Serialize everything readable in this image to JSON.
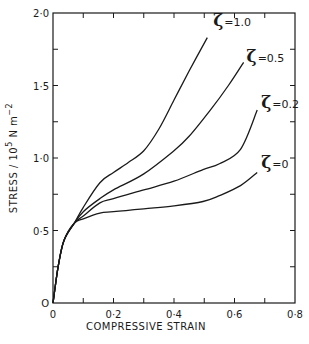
{
  "chart_data": {
    "type": "line",
    "title": "",
    "xlabel": "COMPRESSIVE STRAIN",
    "ylabel": "STRESS / 10^5 N m^-2",
    "ylabel_parts": {
      "main": "STRESS / 10",
      "exp1": "5",
      "unit": " N m",
      "exp2": "−2"
    },
    "xlim": [
      0,
      0.8
    ],
    "ylim": [
      0,
      2.0
    ],
    "x_ticks": [
      0,
      0.1,
      0.2,
      0.3,
      0.4,
      0.5,
      0.6,
      0.7,
      0.8
    ],
    "x_tick_labels": [
      {
        "value": 0,
        "label": "0"
      },
      {
        "value": 0.2,
        "label": "0·2"
      },
      {
        "value": 0.4,
        "label": "0·4"
      },
      {
        "value": 0.6,
        "label": "0·6"
      },
      {
        "value": 0.8,
        "label": "0·8"
      }
    ],
    "y_ticks": [
      0,
      0.25,
      0.5,
      0.75,
      1.0,
      1.25,
      1.5,
      1.75,
      2.0
    ],
    "y_tick_labels": [
      {
        "value": 0,
        "label": "O"
      },
      {
        "value": 0.5,
        "label": "0·5"
      },
      {
        "value": 1.0,
        "label": "1·0"
      },
      {
        "value": 1.5,
        "label": "1·5"
      },
      {
        "value": 2.0,
        "label": "2·0"
      }
    ],
    "grid": false,
    "legend": "inline labels at curve ends",
    "series": [
      {
        "name": "ζ = 1.0",
        "label_value": "=1.0",
        "x": [
          0,
          0.017,
          0.036,
          0.07,
          0.1,
          0.155,
          0.2,
          0.25,
          0.3,
          0.35,
          0.4,
          0.45,
          0.51
        ],
        "y": [
          0,
          0.25,
          0.43,
          0.55,
          0.66,
          0.83,
          0.9,
          0.97,
          1.05,
          1.2,
          1.4,
          1.6,
          1.83
        ]
      },
      {
        "name": "ζ = 0.5",
        "label_value": "=0.5",
        "x": [
          0,
          0.017,
          0.036,
          0.07,
          0.1,
          0.155,
          0.2,
          0.3,
          0.4,
          0.45,
          0.52,
          0.58,
          0.63
        ],
        "y": [
          0,
          0.25,
          0.43,
          0.55,
          0.63,
          0.72,
          0.78,
          0.89,
          1.05,
          1.15,
          1.33,
          1.5,
          1.66
        ]
      },
      {
        "name": "ζ = 0.2",
        "label_value": "=0.2",
        "x": [
          0,
          0.017,
          0.036,
          0.07,
          0.1,
          0.155,
          0.2,
          0.3,
          0.4,
          0.496,
          0.55,
          0.62,
          0.675
        ],
        "y": [
          0,
          0.25,
          0.43,
          0.55,
          0.6,
          0.69,
          0.72,
          0.78,
          0.84,
          0.92,
          0.96,
          1.06,
          1.33
        ]
      },
      {
        "name": "ζ = 0",
        "label_value": "=0",
        "x": [
          0,
          0.017,
          0.036,
          0.07,
          0.1,
          0.155,
          0.2,
          0.3,
          0.4,
          0.496,
          0.55,
          0.62,
          0.675
        ],
        "y": [
          0,
          0.25,
          0.43,
          0.55,
          0.58,
          0.62,
          0.63,
          0.65,
          0.67,
          0.7,
          0.74,
          0.81,
          0.9
        ]
      }
    ]
  },
  "labels": {
    "zeta_symbol": "ζ"
  }
}
